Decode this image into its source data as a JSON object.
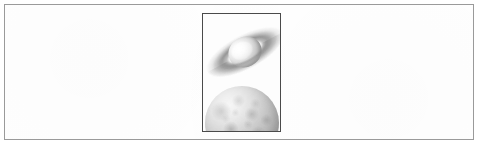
{
  "figure": {
    "panel_background": "#ffffff",
    "panel_border_color": "#9a9a9a",
    "illustration_frame_border_color": "#4a4a4a",
    "caption": "",
    "label": ""
  },
  "illustration": {
    "title": "",
    "style": "grayscale astronomical illustration",
    "orientation": "portrait",
    "objects": [
      {
        "name": "ringed-planet",
        "description": "Saturn-like ringed planet tilted diagonally, upper portion of frame",
        "tone": "light gray with white highlight"
      },
      {
        "name": "moon-sphere",
        "description": "Large cratered spherical body cropped by the bottom edge of the frame",
        "tone": "mottled medium gray"
      }
    ]
  }
}
